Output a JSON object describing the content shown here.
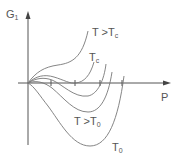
{
  "diagram": {
    "title": "",
    "axes": {
      "y_label": "G",
      "y_label_sub": "1",
      "x_label": "P"
    },
    "curves": [
      {
        "id": "t-gt-tc",
        "label": "T >T",
        "label_sub": "c"
      },
      {
        "id": "t-c",
        "label": "T",
        "label_sub": "c"
      },
      {
        "id": "t-between",
        "label": "",
        "label_sub": ""
      },
      {
        "id": "t-gt-t0",
        "label": "T >T",
        "label_sub": "0"
      },
      {
        "id": "t-0",
        "label": "T",
        "label_sub": "0"
      }
    ],
    "colors": {
      "axis": "#555555",
      "curve": "#777777",
      "text": "#555555"
    }
  }
}
